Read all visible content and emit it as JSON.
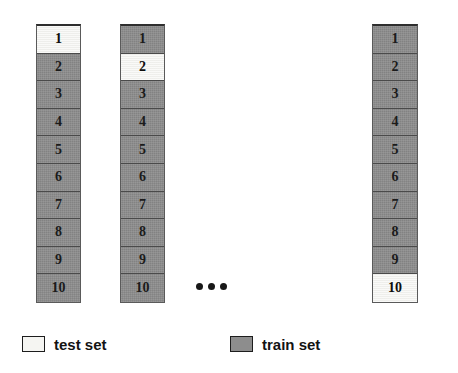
{
  "diagram": {
    "title_text": "",
    "colors": {
      "train_fill": "#8d8d8d",
      "test_fill": "#f4f4f1",
      "border": "#1d1d1d",
      "text": "#131313",
      "background": "#ffffff"
    },
    "columns": [
      {
        "name": "fold-1",
        "left": 36,
        "top": 24,
        "width": 45,
        "cells": [
          {
            "label": "1",
            "role": "test"
          },
          {
            "label": "2",
            "role": "train"
          },
          {
            "label": "3",
            "role": "train"
          },
          {
            "label": "4",
            "role": "train"
          },
          {
            "label": "5",
            "role": "train"
          },
          {
            "label": "6",
            "role": "train"
          },
          {
            "label": "7",
            "role": "train"
          },
          {
            "label": "8",
            "role": "train"
          },
          {
            "label": "9",
            "role": "train"
          },
          {
            "label": "10",
            "role": "train"
          }
        ]
      },
      {
        "name": "fold-2",
        "left": 120,
        "top": 24,
        "width": 45,
        "cells": [
          {
            "label": "1",
            "role": "train"
          },
          {
            "label": "2",
            "role": "test"
          },
          {
            "label": "3",
            "role": "train"
          },
          {
            "label": "4",
            "role": "train"
          },
          {
            "label": "5",
            "role": "train"
          },
          {
            "label": "6",
            "role": "train"
          },
          {
            "label": "7",
            "role": "train"
          },
          {
            "label": "8",
            "role": "train"
          },
          {
            "label": "9",
            "role": "train"
          },
          {
            "label": "10",
            "role": "train"
          }
        ]
      },
      {
        "name": "fold-10",
        "left": 372,
        "top": 24,
        "width": 46,
        "cells": [
          {
            "label": "1",
            "role": "train"
          },
          {
            "label": "2",
            "role": "train"
          },
          {
            "label": "3",
            "role": "train"
          },
          {
            "label": "4",
            "role": "train"
          },
          {
            "label": "5",
            "role": "train"
          },
          {
            "label": "6",
            "role": "train"
          },
          {
            "label": "7",
            "role": "train"
          },
          {
            "label": "8",
            "role": "train"
          },
          {
            "label": "9",
            "role": "train"
          },
          {
            "label": "10",
            "role": "test"
          }
        ]
      }
    ],
    "ellipsis": {
      "label": "...",
      "dot_count": 3
    },
    "legend": {
      "test": {
        "label": "test set",
        "swatch_role": "test"
      },
      "train": {
        "label": "train set",
        "swatch_role": "train"
      }
    }
  }
}
